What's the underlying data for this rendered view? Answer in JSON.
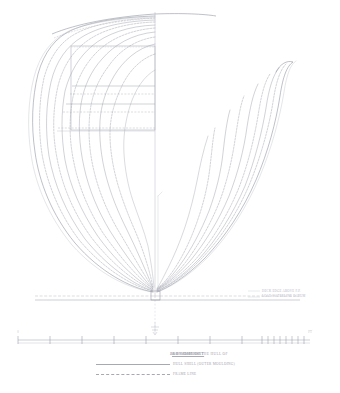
{
  "drawing": {
    "type": "body-plan",
    "medium_note": "faint pencil and ink technical lines plan on white paper",
    "title_line": "BODY PLAN OF THE HULL OF",
    "vessel_name": "S.S. SOMETHING",
    "title_suffix": "IN SECTION 1:1",
    "paper_color": "#ffffff",
    "line_color": "#9a9ca8",
    "faint_line_color": "#c2c4cd",
    "dark_line_color": "#6f7280"
  },
  "centerline": {
    "label": "centre-line",
    "x": 155,
    "top_y": 12,
    "bottom_y": 298
  },
  "baseline": {
    "label": "base line",
    "y": 300,
    "x_start": 35,
    "x_end": 300
  },
  "waterline_notes": [
    "DECK EDGE ABOVE F.P.",
    "LOAD WATERLINE DATUM"
  ],
  "deck": {
    "sheer_label": "deck sheer line",
    "bulwark_label": "bulwark / deckhouse box"
  },
  "waterlines": {
    "label": "waterlines",
    "count": 4,
    "styles": [
      "solid",
      "dashed",
      "solid",
      "dashed"
    ]
  },
  "stations": {
    "aft_body_label": "aft body stations",
    "aft_body_count": 11,
    "fore_body_label": "fore body stations",
    "fore_body_count": 9,
    "styles": [
      "solid",
      "dashed"
    ]
  },
  "keel": {
    "label": "keel / deadwood",
    "x": 155,
    "y": 292
  },
  "draft_mark": {
    "label": "draft mark",
    "x": 155,
    "y": 330
  },
  "scale_bar": {
    "label": "scale of feet",
    "y": 340,
    "x_start": 18,
    "x_end": 310,
    "major_ticks": 9,
    "minor_ticks": 6,
    "tick_labels": [
      "0",
      "",
      "",
      "",
      "",
      "",
      "",
      "",
      ""
    ],
    "unit_label": "FT"
  },
  "caption": {
    "line1_prefix": "BODY PLAN OF THE HULL OF",
    "line1_vessel": "S.S. SOMERSET",
    "line1_suffix": "AS DRAWN 1911",
    "legend": [
      {
        "style": "solid",
        "label": "HULL SHELL (OUTER MOULDING)"
      },
      {
        "style": "dashed",
        "label": "FRAME LINE"
      }
    ]
  }
}
